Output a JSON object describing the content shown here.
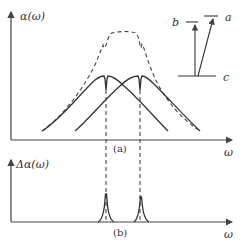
{
  "figure": {
    "panel_a": {
      "y_axis_label": "α(ω)",
      "x_axis_label": "ω",
      "caption": "(a)"
    },
    "panel_b": {
      "y_axis_label": "Δα(ω)",
      "x_axis_label": "ω",
      "caption": "(b)"
    },
    "level_diagram": {
      "levels": [
        "b",
        "a",
        "c"
      ]
    }
  }
}
